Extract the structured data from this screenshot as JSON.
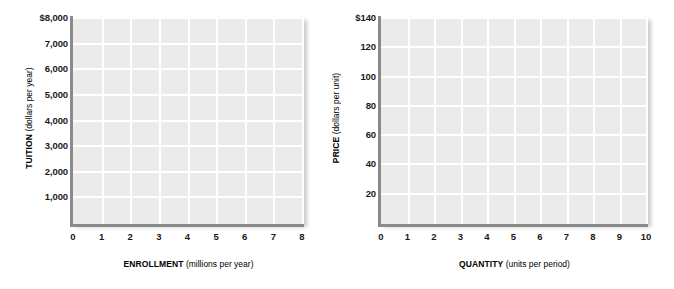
{
  "figure": {
    "background_color": "#ffffff",
    "plot_background_color": "#ebebeb",
    "gridline_color": "#ffffff",
    "axis_line_color": "#8a8a8a",
    "text_color": "#1a1a1a"
  },
  "chart_data": [
    {
      "type": "line",
      "name": "tuition-enrollment-grid",
      "title": "",
      "subtitle": "",
      "xlabel_bold": "ENROLLMENT",
      "xlabel_unit": "(millions per year)",
      "xlabel": "ENROLLMENT (millions per year)",
      "ylabel_bold": "TUITION",
      "ylabel_unit": "(dollars per year)",
      "ylabel": "TUITION (dollars per year)",
      "x_ticks": [
        "0",
        "1",
        "2",
        "3",
        "4",
        "5",
        "6",
        "7",
        "8"
      ],
      "x_values": [
        0,
        1,
        2,
        3,
        4,
        5,
        6,
        7,
        8
      ],
      "y_ticks": [
        "",
        "1,000",
        "2,000",
        "3,000",
        "4,000",
        "5,000",
        "6,000",
        "7,000",
        "$8,000"
      ],
      "y_values": [
        0,
        1000,
        2000,
        3000,
        4000,
        5000,
        6000,
        7000,
        8000
      ],
      "xlim": [
        0,
        8
      ],
      "ylim": [
        0,
        8000
      ],
      "grid": true,
      "legend": "none",
      "series": []
    },
    {
      "type": "line",
      "name": "price-quantity-grid",
      "title": "",
      "subtitle": "",
      "xlabel_bold": "QUANTITY",
      "xlabel_unit": "(units per period)",
      "xlabel": "QUANTITY (units per period)",
      "ylabel_bold": "PRICE",
      "ylabel_unit": "(dollars per unit)",
      "ylabel": "PRICE (dollars per unit)",
      "x_ticks": [
        "0",
        "1",
        "2",
        "3",
        "4",
        "5",
        "6",
        "7",
        "8",
        "9",
        "10"
      ],
      "x_values": [
        0,
        1,
        2,
        3,
        4,
        5,
        6,
        7,
        8,
        9,
        10
      ],
      "y_ticks": [
        "",
        "20",
        "40",
        "60",
        "80",
        "100",
        "120",
        "$140"
      ],
      "y_values": [
        0,
        20,
        40,
        60,
        80,
        100,
        120,
        140
      ],
      "xlim": [
        0,
        10
      ],
      "ylim": [
        0,
        140
      ],
      "grid": true,
      "legend": "none",
      "series": []
    }
  ]
}
